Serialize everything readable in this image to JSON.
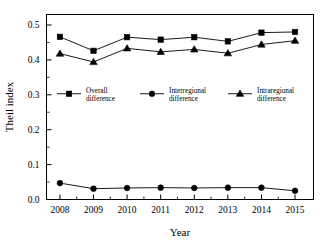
{
  "chart_data": {
    "type": "line",
    "title": "",
    "xlabel": "Year",
    "ylabel": "Theil index",
    "categories": [
      "2008",
      "2009",
      "2010",
      "2011",
      "2012",
      "2013",
      "2014",
      "2015"
    ],
    "x": [
      2008,
      2009,
      2010,
      2011,
      2012,
      2013,
      2014,
      2015
    ],
    "xlim": [
      2007.6,
      2015.55
    ],
    "ylim": [
      0.0,
      0.53
    ],
    "yticks": [
      0.0,
      0.1,
      0.2,
      0.3,
      0.4,
      0.5
    ],
    "ytick_labels": [
      "0.0",
      "0.1",
      "0.2",
      "0.3",
      "0.4",
      "0.5"
    ],
    "yminor_step": 0.05,
    "xtick_labels": [
      "2008",
      "2009",
      "2010",
      "2011",
      "2012",
      "2013",
      "2014",
      "2015"
    ],
    "grid": false,
    "legend_position": "center-left-inside",
    "series": [
      {
        "name": "Overall difference",
        "marker": "square",
        "color": "#000000",
        "values": [
          0.466,
          0.426,
          0.465,
          0.458,
          0.465,
          0.453,
          0.478,
          0.48
        ]
      },
      {
        "name": "Interregional difference",
        "marker": "circle",
        "color": "#000000",
        "values": [
          0.047,
          0.031,
          0.033,
          0.034,
          0.033,
          0.034,
          0.034,
          0.025
        ]
      },
      {
        "name": "Intraregional difference",
        "marker": "triangle",
        "color": "#000000",
        "values": [
          0.418,
          0.394,
          0.433,
          0.423,
          0.43,
          0.419,
          0.444,
          0.455
        ]
      }
    ]
  },
  "legend": {
    "items": [
      {
        "label_line1": "Overall",
        "label_line2": "difference",
        "marker": "square"
      },
      {
        "label_line1": "Interregional",
        "label_line2": "difference",
        "marker": "circle"
      },
      {
        "label_line1": "Intraregional",
        "label_line2": "difference",
        "marker": "triangle"
      }
    ]
  },
  "axes": {
    "x_title": "Year",
    "y_title": "Theil index"
  },
  "colors": {
    "ink": "#000000",
    "background": "#ffffff"
  }
}
